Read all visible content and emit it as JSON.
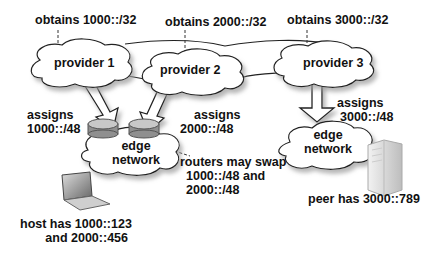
{
  "diagram": {
    "providers": [
      {
        "id": "p1",
        "label": "provider 1",
        "obtains": "obtains 1000::/32"
      },
      {
        "id": "p2",
        "label": "provider 2",
        "obtains": "obtains 2000::/32"
      },
      {
        "id": "p3",
        "label": "provider 3",
        "obtains": "obtains 3000::/32"
      }
    ],
    "assignments": [
      {
        "from": "p1",
        "line1": "assigns",
        "line2": "1000::/48"
      },
      {
        "from": "p2",
        "line1": "assigns",
        "line2": "2000::/48"
      },
      {
        "from": "p3",
        "line1": "assigns",
        "line2": "3000::/48"
      }
    ],
    "edge_networks": [
      {
        "id": "edge-left",
        "line1": "edge",
        "line2": "network"
      },
      {
        "id": "edge-right",
        "line1": "edge",
        "line2": "network"
      }
    ],
    "routers_note": {
      "line1": "routers may swap",
      "line2": "1000::/48 and",
      "line3": "2000::/48"
    },
    "host": {
      "line1": "host has 1000::123",
      "line2": "and 2000::456"
    },
    "peer": {
      "line1": "peer has 3000::789"
    },
    "colors": {
      "stroke": "#222222",
      "cloud_fill": "#ffffff",
      "shadow": "#bbbbbb",
      "router": "#9a9a9a"
    }
  }
}
